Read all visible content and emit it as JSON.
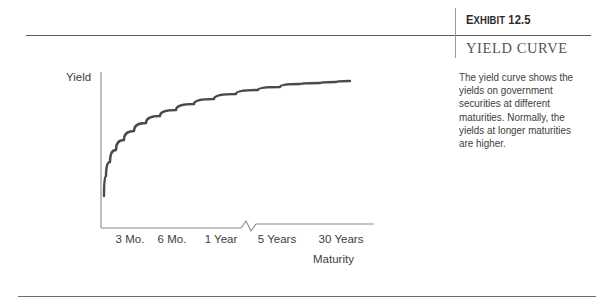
{
  "exhibit": {
    "number_label": "Exhibit 12.5",
    "number_prefix": "E",
    "number_rest": "XHIBIT",
    "number_value": "12.5",
    "title": "YIELD CURVE"
  },
  "caption": {
    "text": "The yield curve shows the yields on government securities at different maturities. Normally, the yields at longer maturities are higher."
  },
  "chart_data": {
    "type": "line",
    "title": "YIELD CURVE",
    "xlabel": "Maturity",
    "ylabel": "Yield",
    "grid": false,
    "legend": null,
    "axis_break": {
      "present": true,
      "between": [
        "1 Year",
        "5 Years"
      ],
      "x_px": 248
    },
    "categories": [
      "3 Mo.",
      "6 Mo.",
      "1 Year",
      "5 Years",
      "30 Years"
    ],
    "tick_positions_px": [
      130,
      172,
      221,
      277,
      341
    ],
    "series": [
      {
        "name": "Yield curve",
        "x": [
          "3 Mo.",
          "6 Mo.",
          "1 Year",
          "5 Years",
          "30 Years"
        ],
        "values": [
          1.0,
          2.1,
          3.3,
          4.6,
          5.3
        ],
        "color": "#4a4a4a"
      }
    ],
    "xlim_px": [
      101,
      360
    ],
    "ylim_px": [
      228,
      72
    ],
    "curve_points_px": [
      [
        104,
        196
      ],
      [
        106,
        176
      ],
      [
        110,
        162
      ],
      [
        116,
        150
      ],
      [
        124,
        140
      ],
      [
        134,
        131
      ],
      [
        146,
        123
      ],
      [
        160,
        116
      ],
      [
        176,
        110
      ],
      [
        194,
        104
      ],
      [
        214,
        99
      ],
      [
        236,
        94
      ],
      [
        258,
        90
      ],
      [
        280,
        87
      ],
      [
        300,
        84
      ],
      [
        320,
        83
      ],
      [
        336,
        82
      ],
      [
        350,
        81
      ]
    ]
  },
  "axes": {
    "y_label": "Yield",
    "x_label": "Maturity",
    "color": "#8a8a8a"
  },
  "colors": {
    "curve": "#4a4a4a",
    "rule": "#5a5a5a",
    "text": "#3d3d3d",
    "title": "#555555"
  }
}
